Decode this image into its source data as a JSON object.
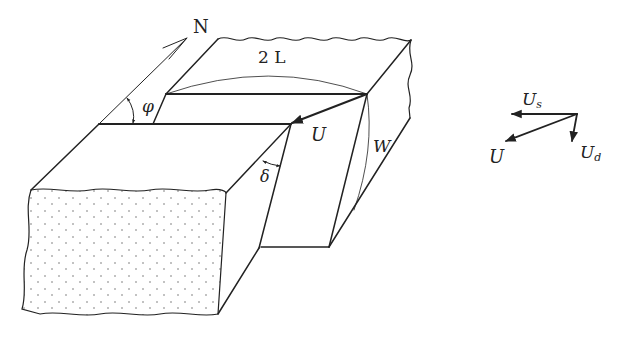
{
  "figure": {
    "type": "fault-block-diagram",
    "labels": {
      "north": "N",
      "length": "2 L",
      "strike_angle": "φ",
      "dip_angle": "δ",
      "slip": "U",
      "width": "W"
    },
    "vector_diagram": {
      "strike_slip": "U",
      "strike_slip_sub": "s",
      "dip_slip": "U",
      "dip_slip_sub": "d",
      "total_slip": "U"
    }
  }
}
